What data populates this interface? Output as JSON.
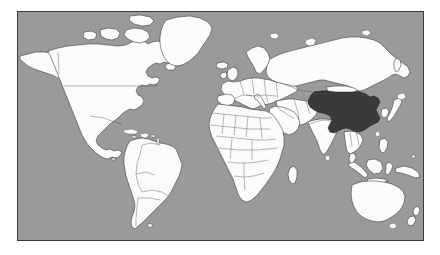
{
  "figure": {
    "type": "world-map",
    "caption": "",
    "background_color": "#ffffff",
    "frame": {
      "border_color": "#3a3a3a",
      "border_width_px": 1,
      "x": 17,
      "y": 11,
      "width": 407,
      "height": 230
    }
  },
  "map": {
    "projection": "equirectangular",
    "ocean_color": "#9a9a9a",
    "land_color": "#fbfbfb",
    "land_border_color": "#333333",
    "country_border_color": "#4a4a4a",
    "highlight_color": "#3a3a3a",
    "highlight_border_color": "#1d1d1d",
    "highlighted_countries": [
      "China"
    ],
    "legend": [
      {
        "swatch": "#3a3a3a",
        "label": "Highlighted country"
      },
      {
        "swatch": "#fbfbfb",
        "label": "Other countries"
      },
      {
        "swatch": "#9a9a9a",
        "label": "Ocean"
      }
    ],
    "regions": [
      {
        "name": "North America",
        "highlighted": false
      },
      {
        "name": "Greenland",
        "highlighted": false
      },
      {
        "name": "South America",
        "highlighted": false
      },
      {
        "name": "Europe",
        "highlighted": false
      },
      {
        "name": "Africa",
        "highlighted": false
      },
      {
        "name": "Russia",
        "highlighted": false
      },
      {
        "name": "Middle East",
        "highlighted": false
      },
      {
        "name": "India",
        "highlighted": false
      },
      {
        "name": "China",
        "highlighted": true
      },
      {
        "name": "Southeast Asia",
        "highlighted": false
      },
      {
        "name": "Japan",
        "highlighted": false
      },
      {
        "name": "Indonesia",
        "highlighted": false
      },
      {
        "name": "Australia",
        "highlighted": false
      },
      {
        "name": "New Zealand",
        "highlighted": false
      }
    ]
  }
}
